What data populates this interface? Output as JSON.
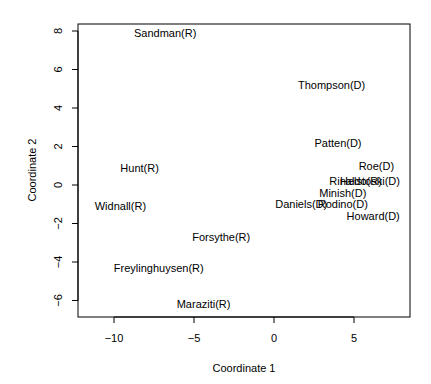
{
  "chart_data": {
    "type": "scatter",
    "title": "",
    "xlabel": "Coordinate 1",
    "ylabel": "Coordinate 2",
    "xlim": [
      -12.3,
      8.5
    ],
    "ylim": [
      -6.9,
      8.4
    ],
    "x_ticks": [
      -10,
      -5,
      0,
      5
    ],
    "x_tick_labels": [
      "−10",
      "−5",
      "0",
      "5"
    ],
    "y_ticks": [
      -6,
      -4,
      -2,
      0,
      2,
      4,
      6,
      8
    ],
    "y_tick_labels": [
      "−6",
      "−4",
      "−2",
      "0",
      "2",
      "4",
      "6",
      "8"
    ],
    "grid": false,
    "legend": null,
    "points": [
      {
        "label": "Sandman(R)",
        "x": -6.8,
        "y": 7.9
      },
      {
        "label": "Thompson(D)",
        "x": 3.6,
        "y": 5.2
      },
      {
        "label": "Patten(D)",
        "x": 4.0,
        "y": 2.2
      },
      {
        "label": "Roe(D)",
        "x": 6.4,
        "y": 1.0
      },
      {
        "label": "Rinaldo(R)",
        "x": 5.1,
        "y": 0.2
      },
      {
        "label": "Helstoski(D)",
        "x": 6.0,
        "y": 0.2
      },
      {
        "label": "Hunt(R)",
        "x": -8.4,
        "y": 0.9
      },
      {
        "label": "Minish(D)",
        "x": 4.3,
        "y": -0.4
      },
      {
        "label": "Daniels(D)",
        "x": 1.7,
        "y": -1.0
      },
      {
        "label": "Rodino(D)",
        "x": 4.3,
        "y": -1.0
      },
      {
        "label": "Howard(D)",
        "x": 6.2,
        "y": -1.6
      },
      {
        "label": "Widnall(R)",
        "x": -9.6,
        "y": -1.1
      },
      {
        "label": "Forsythe(R)",
        "x": -3.3,
        "y": -2.7
      },
      {
        "label": "Freylinghuysen(R)",
        "x": -7.2,
        "y": -4.3
      },
      {
        "label": "Maraziti(R)",
        "x": -4.4,
        "y": -6.2
      }
    ]
  }
}
